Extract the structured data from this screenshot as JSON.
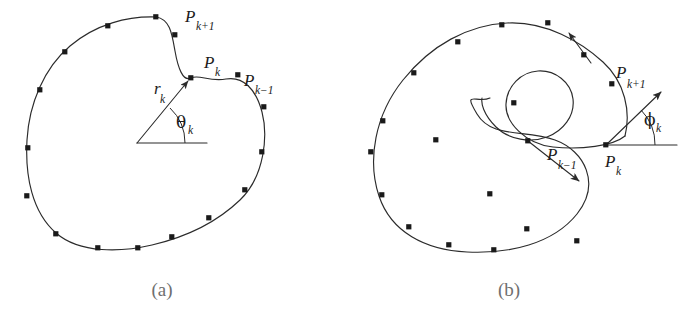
{
  "figure": {
    "background_color": "#ffffff",
    "stroke_color": "#2b2b2b",
    "node_color": "#1a1a1a",
    "caption_color": "#6f6f6f"
  },
  "panel_a": {
    "caption": "(a)",
    "labels": {
      "p_k_base": "P",
      "p_k_sub": "k",
      "p_kplus1_base": "P",
      "p_kplus1_sub": "k+1",
      "p_kminus1_base": "P",
      "p_kminus1_sub": "k−1",
      "radius_base": "r",
      "radius_sub": "k",
      "angle_base": "θ",
      "angle_sub": "k"
    },
    "description": "Closed smooth blob contour sampled by boundary points; a radius vector r_k from an interior origin to boundary point P_k makes angle theta_k with the horizontal reference axis.",
    "origin": {
      "x": 137,
      "y": 143
    },
    "p_k": {
      "x": 191,
      "y": 78
    },
    "baseline_end": {
      "x": 207,
      "y": 143
    },
    "sample_points": [
      {
        "x": 156,
        "y": 17
      },
      {
        "x": 108,
        "y": 26
      },
      {
        "x": 65,
        "y": 52
      },
      {
        "x": 40,
        "y": 90
      },
      {
        "x": 28,
        "y": 148
      },
      {
        "x": 27,
        "y": 196
      },
      {
        "x": 56,
        "y": 234
      },
      {
        "x": 98,
        "y": 248
      },
      {
        "x": 138,
        "y": 248
      },
      {
        "x": 172,
        "y": 237
      },
      {
        "x": 209,
        "y": 218
      },
      {
        "x": 245,
        "y": 190
      },
      {
        "x": 262,
        "y": 152
      },
      {
        "x": 264,
        "y": 107
      },
      {
        "x": 238,
        "y": 75
      },
      {
        "x": 191,
        "y": 78
      },
      {
        "x": 175,
        "y": 35
      }
    ]
  },
  "panel_b": {
    "caption": "(b)",
    "labels": {
      "p_k_base": "P",
      "p_k_sub": "k",
      "p_kplus1_base": "P",
      "p_kplus1_sub": "k+1",
      "p_kminus1_base": "P",
      "p_kminus1_sub": "k−1",
      "angle_base": "ϕ",
      "angle_sub": "k"
    },
    "description": "Open spiral (C-shaped) contour sampled by boundary points; tangent direction arrows at successive points, with phi_k the tangent angle at P_k measured from the horizontal reference axis.",
    "p_k": {
      "x": 265,
      "y": 145
    },
    "baseline_end": {
      "x": 336,
      "y": 145
    },
    "tangent_arrow_tip": {
      "x": 322,
      "y": 90
    },
    "sample_points": [
      {
        "x": 117,
        "y": 42
      },
      {
        "x": 161,
        "y": 25
      },
      {
        "x": 207,
        "y": 23
      },
      {
        "x": 243,
        "y": 55
      },
      {
        "x": 187,
        "y": 141
      },
      {
        "x": 149,
        "y": 194
      },
      {
        "x": 186,
        "y": 229
      },
      {
        "x": 236,
        "y": 241
      },
      {
        "x": 262,
        "y": 145
      },
      {
        "x": 73,
        "y": 73
      },
      {
        "x": 42,
        "y": 121
      },
      {
        "x": 30,
        "y": 152
      },
      {
        "x": 41,
        "y": 195
      },
      {
        "x": 68,
        "y": 227
      },
      {
        "x": 108,
        "y": 245
      },
      {
        "x": 153,
        "y": 250
      },
      {
        "x": 95,
        "y": 140
      },
      {
        "x": 129,
        "y": 104
      }
    ]
  },
  "icons": {
    "arrowhead": "arrow-head-icon",
    "angle_arc": "angle-arc-icon",
    "sample_node": "sample-point-icon"
  }
}
